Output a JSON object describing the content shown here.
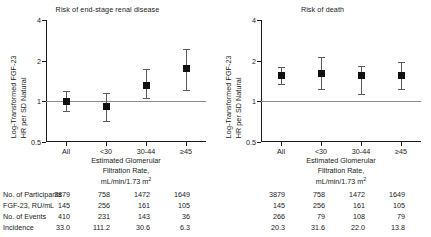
{
  "chart_data": {
    "type": "scatter",
    "layout": "two panels side by side, forest/point-estimate plot with 95% CI whiskers",
    "shared": {
      "categories": [
        "All",
        "<30",
        "30-44",
        "≥45"
      ],
      "ylabel_line1": "HR per SD Natural",
      "ylabel_line2": "Log-Transformed FGF-23",
      "xlabel_line1": "Estimated Glomerular",
      "xlabel_line2": "Filtration Rate,",
      "xlabel_line3": "mL/min/1.73 m",
      "xlabel_sup": "2",
      "yticks": [
        "0.5",
        "1",
        "2",
        "4"
      ],
      "ytick_values": [
        0.5,
        1,
        2,
        4
      ],
      "ylim": [
        0.5,
        4
      ],
      "yscale": "log",
      "refline": 1.0,
      "grid": false,
      "legend": "none",
      "marker_color": "#111111",
      "whisker_color": "#5a5a5a",
      "refline_color": "#8c8c8c"
    },
    "panels": [
      {
        "title": "Risk of end-stage renal disease",
        "values": [
          1.0,
          0.92,
          1.32,
          1.76
        ],
        "ci_low": [
          0.85,
          0.72,
          1.05,
          1.21
        ],
        "ci_high": [
          1.2,
          1.16,
          1.74,
          2.43
        ]
      },
      {
        "title": "Risk of death",
        "values": [
          1.55,
          1.62,
          1.55,
          1.55
        ],
        "ci_low": [
          1.34,
          1.23,
          1.13,
          1.23
        ],
        "ci_high": [
          1.79,
          2.13,
          1.82,
          1.95
        ]
      }
    ]
  },
  "panels": {
    "left": {
      "title": "Risk of end-stage renal disease"
    },
    "right": {
      "title": "Risk of death"
    }
  },
  "axes": {
    "ylabel_line1": "HR per SD Natural",
    "ylabel_line2": "Log-Transformed FGF-23",
    "ytick_0": "0.5",
    "ytick_1": "1",
    "ytick_2": "2",
    "ytick_3": "4",
    "xtick_0": "All",
    "xtick_1": "<30",
    "xtick_2": "30-44",
    "xtick_3": "≥45",
    "xcap_line1": "Estimated Glomerular",
    "xcap_line2": "Filtration Rate,",
    "xcap_line3": "mL/min/1.73 m",
    "xcap_sup": "2"
  },
  "table": {
    "row_labels": [
      "No. of Participants",
      "FGF-23, RU/mL",
      "No. of Events",
      "Incidence"
    ],
    "left": [
      [
        "3879",
        "758",
        "1472",
        "1649"
      ],
      [
        "145",
        "256",
        "161",
        "105"
      ],
      [
        "410",
        "231",
        "143",
        "36"
      ],
      [
        "33.0",
        "111.2",
        "30.6",
        "6.3"
      ]
    ],
    "right": [
      [
        "3879",
        "758",
        "1472",
        "1649"
      ],
      [
        "145",
        "256",
        "161",
        "105"
      ],
      [
        "266",
        "79",
        "108",
        "79"
      ],
      [
        "20.3",
        "31.6",
        "22.0",
        "13.8"
      ]
    ]
  }
}
